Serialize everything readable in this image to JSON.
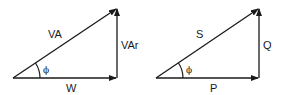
{
  "diagrams": [
    {
      "name": "power-triangle-units",
      "hypotenuse": "VA",
      "adjacent": "W",
      "opposite": "VAr",
      "angle": "ϕ"
    },
    {
      "name": "power-triangle-symbols",
      "hypotenuse": "S",
      "adjacent": "P",
      "opposite": "Q",
      "angle": "ϕ"
    }
  ],
  "colors": {
    "stroke": "#1a1a1a",
    "background": "#ffffff"
  }
}
